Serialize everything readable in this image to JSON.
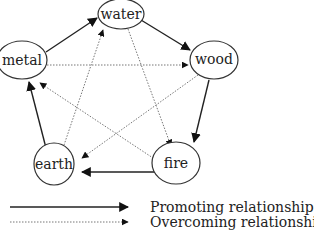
{
  "diagram": {
    "nodes": [
      {
        "id": "water",
        "label": "water",
        "cx": 121,
        "cy": 14,
        "rx": 23,
        "ry": 15
      },
      {
        "id": "metal",
        "label": "metal",
        "cx": 22,
        "cy": 60,
        "rx": 25,
        "ry": 19
      },
      {
        "id": "wood",
        "label": "wood",
        "cx": 214,
        "cy": 60,
        "rx": 24,
        "ry": 19
      },
      {
        "id": "earth",
        "label": "earth",
        "cx": 54,
        "cy": 164,
        "rx": 20,
        "ry": 21
      },
      {
        "id": "fire",
        "label": "fire",
        "cx": 176,
        "cy": 163,
        "rx": 24,
        "ry": 21
      }
    ],
    "promoting_edges": [
      {
        "from": "metal",
        "to": "water"
      },
      {
        "from": "water",
        "to": "wood"
      },
      {
        "from": "wood",
        "to": "fire"
      },
      {
        "from": "fire",
        "to": "earth"
      },
      {
        "from": "earth",
        "to": "metal"
      }
    ],
    "overcoming_edges": [
      {
        "from": "metal",
        "to": "wood"
      },
      {
        "from": "wood",
        "to": "earth"
      },
      {
        "from": "earth",
        "to": "water"
      },
      {
        "from": "water",
        "to": "fire"
      },
      {
        "from": "fire",
        "to": "metal"
      }
    ]
  },
  "legend": {
    "promoting_label": "Promoting relationship",
    "overcoming_label": "Overcoming relationship"
  },
  "colors": {
    "solid_edge": "#222222",
    "dotted_edge": "#777777",
    "node_stroke": "#333333"
  }
}
